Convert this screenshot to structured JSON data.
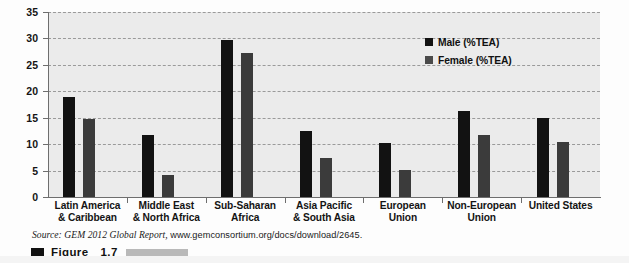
{
  "chart_data": {
    "type": "bar",
    "title": "",
    "xlabel": "",
    "ylabel": "",
    "ylim": [
      0,
      35
    ],
    "yticks": [
      0,
      5,
      10,
      15,
      20,
      25,
      30,
      35
    ],
    "grid": true,
    "legend_position": "top-right",
    "categories": [
      "Latin America & Caribbean",
      "Middle East & North Africa",
      "Sub-Saharan Africa",
      "Asia Pacific & South Asia",
      "European Union",
      "Non-European Union",
      "United States"
    ],
    "category_lines": [
      [
        "Latin America",
        "& Caribbean"
      ],
      [
        "Middle East",
        "& North Africa"
      ],
      [
        "Sub-Saharan",
        "Africa"
      ],
      [
        "Asia Pacific",
        "& South Asia"
      ],
      [
        "European",
        "Union"
      ],
      [
        "Non-European",
        "Union"
      ],
      [
        "United States",
        ""
      ]
    ],
    "series": [
      {
        "name": "Male (%TEA)",
        "color": "#121212",
        "values": [
          19.0,
          11.8,
          29.8,
          12.4,
          10.3,
          16.3,
          14.9
        ]
      },
      {
        "name": "Female (%TEA)",
        "color": "#3b3b3b",
        "values": [
          14.7,
          4.1,
          27.3,
          7.3,
          5.1,
          11.7,
          10.5
        ]
      }
    ]
  },
  "legend": {
    "items": [
      {
        "label": "Male (%TEA)",
        "color": "#121212"
      },
      {
        "label": "Female (%TEA)",
        "color": "#4a4a4a"
      }
    ]
  },
  "source": {
    "prefix": "Source: GEM 2012 Global Report,",
    "url": "www.gemconsortium.org/docs/download/2645."
  },
  "caption": {
    "label": "Figure",
    "number": "1.7"
  },
  "colors": {
    "plot_background": "#ebebeb",
    "page_background": "#fdfdfd",
    "axis": "#6e6e6e",
    "gridline": "#9a9a9a",
    "male_bar": "#121212",
    "female_bar": "#3b3b3b",
    "caption_rule": "#b9b9b9"
  }
}
